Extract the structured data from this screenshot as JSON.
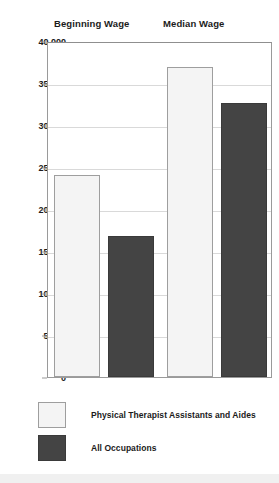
{
  "chart_data": {
    "type": "bar",
    "title": "",
    "xlabel": "",
    "ylabel": "",
    "categories": [
      "Beginning Wage",
      "Median Wage"
    ],
    "series": [
      {
        "name": "Physical Therapist Assistants and Aides",
        "color": "#f4f4f4",
        "values": [
          24000,
          36900
        ]
      },
      {
        "name": "All Occupations",
        "color": "#444444",
        "values": [
          16800,
          32600
        ]
      }
    ],
    "ylim": [
      0,
      40000
    ],
    "ytick_values": [
      0,
      5000,
      10000,
      15000,
      20000,
      25000,
      30000,
      35000,
      40000
    ],
    "ytick_labels": [
      "0",
      "5,000",
      "10,000",
      "15,000",
      "20,000",
      "25,000",
      "30,000",
      "35,000",
      "40,000"
    ],
    "grid": true,
    "legend_position": "bottom-left"
  },
  "group_headers": [
    {
      "label": "Beginning Wage"
    },
    {
      "label": "Median Wage"
    }
  ],
  "legend": {
    "items": [
      {
        "label": "Physical Therapist Assistants and Aides",
        "swatch": "light"
      },
      {
        "label": "All Occupations",
        "swatch": "dark"
      }
    ]
  },
  "colors": {
    "series_light": "#f4f4f4",
    "series_dark": "#444444",
    "axis": "#9a9a9a",
    "grid": "#d9d9d9",
    "text": "#1b1b1b",
    "background": "#ffffff"
  }
}
